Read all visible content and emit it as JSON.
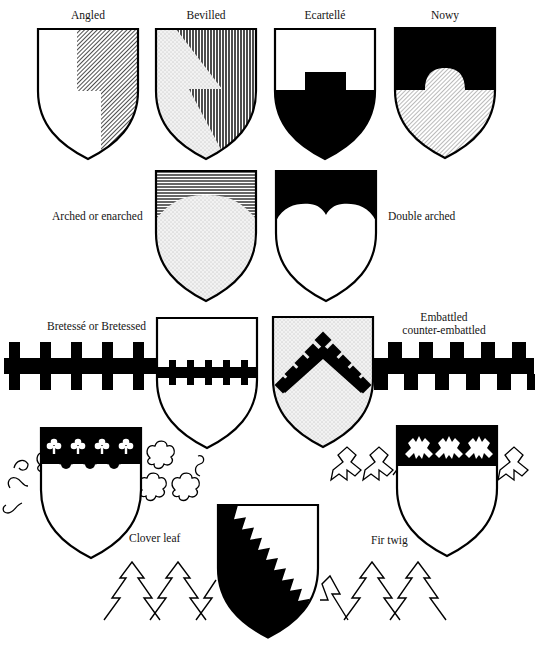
{
  "figure": {
    "colors": {
      "ink": "#000000",
      "field": "#ffffff",
      "stipple": "#e6e6e6",
      "hatch": "#000000"
    }
  },
  "labels": {
    "angled": "Angled",
    "bevilled": "Bevilled",
    "ecartelle": "Ecartellé",
    "nowy": "Nowy",
    "arched": "Arched or enarched",
    "double_arched": "Double arched",
    "bretesse": "Bretessé or Bretessed",
    "embattled_line1": "Embattled",
    "embattled_line2": "counter-embattled",
    "clover_leaf": "Clover leaf",
    "fir_twig": "Fir twig"
  },
  "shields": [
    {
      "id": "angled",
      "tincture_left": "argent",
      "tincture_right": "diagonal hatch"
    },
    {
      "id": "bevilled",
      "tincture_left": "stipple",
      "tincture_right": "vertical hatch"
    },
    {
      "id": "ecartelle",
      "tincture_chief": "argent",
      "tincture_base": "sable"
    },
    {
      "id": "nowy",
      "tincture_chief": "sable",
      "tincture_base": "diagonal hatch"
    },
    {
      "id": "arched",
      "tincture_chief": "horizontal hatch",
      "tincture_base": "stipple"
    },
    {
      "id": "double_arched",
      "tincture_chief": "sable",
      "tincture_base": "argent"
    },
    {
      "id": "bretesse",
      "charge": "bar bretessé sable"
    },
    {
      "id": "embattled",
      "charge": "chevron embattled counter-embattled sable",
      "field": "stipple"
    },
    {
      "id": "clover_leaf",
      "chief": "sable, clover leaf edge"
    },
    {
      "id": "fir_twig_chief",
      "chief": "sable, fir twig edge"
    },
    {
      "id": "fir_twig_bend",
      "division": "per bend fir-twigged, sable and argent"
    }
  ]
}
